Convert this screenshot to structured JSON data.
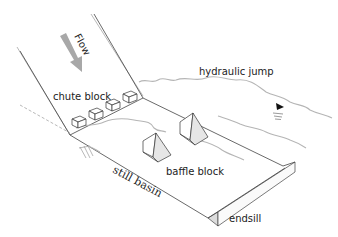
{
  "diagram": {
    "labels": {
      "flow": "Flow",
      "hydraulic_jump": "hydraulic jump",
      "chute_block": "chute block",
      "baffle_block": "baffle block",
      "still_basin": "still basin",
      "endsill": "endsill"
    },
    "colors": {
      "line": "#444444",
      "water_surface": "#b5b5b5",
      "flow_arrow": "#a8a8a8",
      "baffle_face": "#e6e6e6",
      "background": "#ffffff"
    },
    "symbols": {
      "water_level_marker": "inverted-triangle"
    }
  }
}
